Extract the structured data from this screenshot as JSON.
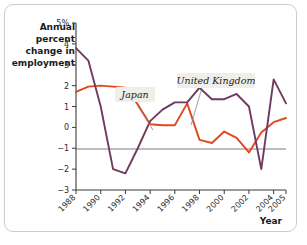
{
  "figure": {
    "card_name": "employment-change-line-chart"
  },
  "chart_data": {
    "type": "line",
    "title": "",
    "ylabel": "Annual percent change in employment",
    "xlabel": "Year",
    "grid": false,
    "legend_position": "inline-annotations",
    "ylim": [
      -3,
      5
    ],
    "xlim": [
      1988,
      2005
    ],
    "ytick_labels": [
      "5%",
      "4",
      "3",
      "2",
      "1",
      "0",
      "-1",
      "-2",
      "-3"
    ],
    "ytick_values": [
      5,
      4,
      3,
      2,
      1,
      0,
      -1,
      -2,
      -3
    ],
    "xtick_labels": [
      "1988",
      "1990",
      "1992",
      "1994",
      "1996",
      "1998",
      "2000",
      "2002",
      "2004",
      "2005"
    ],
    "xtick_values": [
      1988,
      1990,
      1992,
      1994,
      1996,
      1998,
      2000,
      2002,
      2004,
      2005
    ],
    "x": [
      1988,
      1989,
      1990,
      1991,
      1992,
      1993,
      1994,
      1995,
      1996,
      1997,
      1998,
      1999,
      2000,
      2001,
      2002,
      2003,
      2004,
      2005
    ],
    "series": [
      {
        "name": "Japan",
        "color": "#e0481f",
        "values": [
          1.7,
          1.95,
          2.0,
          1.95,
          1.9,
          1.1,
          0.15,
          0.1,
          0.1,
          1.15,
          -0.6,
          -0.75,
          -0.2,
          -0.5,
          -1.2,
          -0.25,
          0.25,
          0.45
        ]
      },
      {
        "name": "United Kingdom",
        "color": "#6f3a60",
        "values": [
          3.8,
          3.2,
          1.0,
          -2.0,
          -2.2,
          -1.0,
          0.3,
          0.85,
          1.2,
          1.2,
          1.9,
          1.35,
          1.35,
          1.6,
          1.0,
          -2.0,
          2.3,
          1.15
        ]
      }
    ],
    "annotations": [
      {
        "text": "Japan",
        "series": "Japan"
      },
      {
        "text": "United Kingdom",
        "series": "United Kingdom"
      }
    ]
  }
}
